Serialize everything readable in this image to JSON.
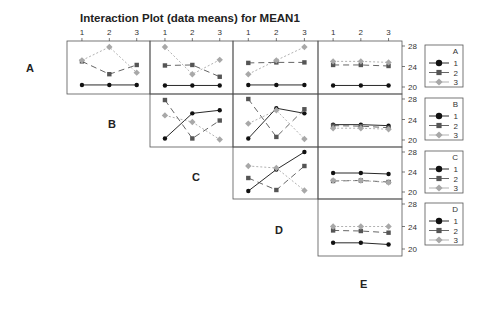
{
  "chart_data": {
    "type": "line",
    "title": "Interaction Plot (data means) for MEAN1",
    "factors": [
      "A",
      "B",
      "C",
      "D",
      "E"
    ],
    "levels": [
      "1",
      "2",
      "3"
    ],
    "ylim": [
      20,
      28
    ],
    "yticks": [
      20,
      24,
      28
    ],
    "grid": false,
    "legend_position": "right",
    "series_style": {
      "1": {
        "color": "#111111",
        "marker": "circle",
        "dash": ""
      },
      "2": {
        "color": "#555555",
        "marker": "square",
        "dash": "6,4"
      },
      "3": {
        "color": "#a8a8a8",
        "marker": "diamond",
        "dash": "2,2"
      }
    },
    "panels": [
      {
        "row_factor": "A",
        "col_factor": "B",
        "series": [
          {
            "name": "1",
            "values": [
              20.4,
              20.4,
              20.4
            ]
          },
          {
            "name": "2",
            "values": [
              25.0,
              22.5,
              24.3
            ]
          },
          {
            "name": "3",
            "values": [
              25.2,
              27.8,
              22.8
            ]
          }
        ]
      },
      {
        "row_factor": "A",
        "col_factor": "C",
        "series": [
          {
            "name": "1",
            "values": [
              20.3,
              20.3,
              20.3
            ]
          },
          {
            "name": "2",
            "values": [
              24.2,
              24.3,
              22.0
            ]
          },
          {
            "name": "3",
            "values": [
              27.8,
              22.5,
              25.3
            ]
          }
        ]
      },
      {
        "row_factor": "A",
        "col_factor": "D",
        "series": [
          {
            "name": "1",
            "values": [
              20.4,
              20.4,
              20.4
            ]
          },
          {
            "name": "2",
            "values": [
              24.7,
              24.8,
              24.8
            ]
          },
          {
            "name": "3",
            "values": [
              22.5,
              25.2,
              27.8
            ]
          }
        ]
      },
      {
        "row_factor": "A",
        "col_factor": "E",
        "series": [
          {
            "name": "1",
            "values": [
              20.3,
              20.3,
              20.3
            ]
          },
          {
            "name": "2",
            "values": [
              24.3,
              24.3,
              24.1
            ]
          },
          {
            "name": "3",
            "values": [
              25.0,
              25.0,
              24.8
            ]
          }
        ]
      },
      {
        "row_factor": "B",
        "col_factor": "C",
        "series": [
          {
            "name": "1",
            "values": [
              20.3,
              25.2,
              25.8
            ]
          },
          {
            "name": "2",
            "values": [
              27.8,
              20.3,
              23.8
            ]
          },
          {
            "name": "3",
            "values": [
              24.8,
              23.5,
              20.1
            ]
          }
        ]
      },
      {
        "row_factor": "B",
        "col_factor": "D",
        "series": [
          {
            "name": "1",
            "values": [
              20.3,
              26.2,
              25.2
            ]
          },
          {
            "name": "2",
            "values": [
              28.0,
              20.6,
              26.0
            ]
          },
          {
            "name": "3",
            "values": [
              23.2,
              25.8,
              20.2
            ]
          }
        ]
      },
      {
        "row_factor": "B",
        "col_factor": "E",
        "series": [
          {
            "name": "1",
            "values": [
              23.0,
              23.0,
              22.8
            ]
          },
          {
            "name": "2",
            "values": [
              22.8,
              22.7,
              22.4
            ]
          },
          {
            "name": "3",
            "values": [
              22.3,
              22.3,
              22.1
            ]
          }
        ]
      },
      {
        "row_factor": "C",
        "col_factor": "D",
        "series": [
          {
            "name": "1",
            "values": [
              20.2,
              24.5,
              28.0
            ]
          },
          {
            "name": "2",
            "values": [
              22.8,
              20.4,
              25.2
            ]
          },
          {
            "name": "3",
            "values": [
              25.2,
              24.8,
              20.3
            ]
          }
        ]
      },
      {
        "row_factor": "C",
        "col_factor": "E",
        "series": [
          {
            "name": "1",
            "values": [
              23.8,
              23.8,
              23.6
            ]
          },
          {
            "name": "2",
            "values": [
              22.2,
              22.3,
              22.0
            ]
          },
          {
            "name": "3",
            "values": [
              22.3,
              22.3,
              21.9
            ]
          }
        ]
      },
      {
        "row_factor": "D",
        "col_factor": "E",
        "series": [
          {
            "name": "1",
            "values": [
              21.1,
              21.1,
              20.8
            ]
          },
          {
            "name": "2",
            "values": [
              23.3,
              23.2,
              22.9
            ]
          },
          {
            "name": "3",
            "values": [
              24.0,
              24.0,
              24.0
            ]
          }
        ]
      }
    ]
  }
}
